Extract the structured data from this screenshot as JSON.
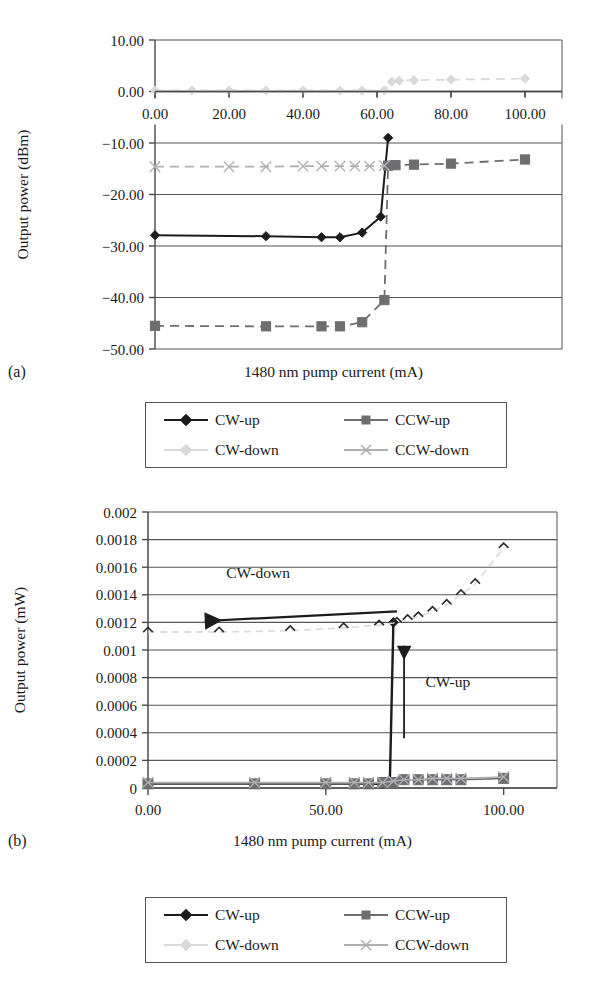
{
  "figure": {
    "panel_a_tag": "(a)",
    "panel_b_tag": "(b)"
  },
  "colors": {
    "cw_up": "#1c1c1c",
    "ccw_up": "#6e6e70",
    "cw_down": "#d9d9d9",
    "ccw_down": "#b0b0b2",
    "axis": "#4a4a4e",
    "grid": "#55555a",
    "text": "#1a1a1a"
  },
  "legend": {
    "entries": [
      {
        "label": "CW-up",
        "series": "cw_up",
        "marker": "diamond",
        "line": true
      },
      {
        "label": "CCW-up",
        "series": "ccw_up",
        "marker": "square",
        "line": true
      },
      {
        "label": "CW-down",
        "series": "cw_down",
        "marker": "diamond",
        "line": true
      },
      {
        "label": "CCW-down",
        "series": "ccw_down",
        "marker": "x",
        "line": true
      }
    ]
  },
  "chart_data": [
    {
      "id": "panel-a",
      "type": "line",
      "title": "",
      "xlabel": "1480 nm pump current (mA)",
      "ylabel": "Output power (dBm)",
      "xlim": [
        0,
        110
      ],
      "ylim": [
        -50,
        10
      ],
      "xticks": [
        0,
        20,
        40,
        60,
        80,
        100
      ],
      "xtick_labels": [
        "0.00",
        "20.00",
        "40.00",
        "60.00",
        "80.00",
        "100.00"
      ],
      "yticks": [
        10,
        0,
        -10,
        -20,
        -30,
        -40,
        -50
      ],
      "ytick_labels": [
        "10.00",
        "0.00",
        "-10.00",
        "-20.00",
        "-30.00",
        "-40.00",
        "-50.00"
      ],
      "grid": true,
      "xaxis_position": "zero",
      "legend_position": "below",
      "series": [
        {
          "name": "CW-up",
          "style": "solid",
          "marker": "diamond",
          "color": "#1c1c1c",
          "x": [
            0,
            30,
            45,
            50,
            56,
            61,
            63
          ],
          "y": [
            -27.9,
            -28.1,
            -28.3,
            -28.3,
            -27.4,
            -24.3,
            -9.0
          ]
        },
        {
          "name": "CCW-up",
          "style": "dashed",
          "marker": "square",
          "color": "#6e6e70",
          "x": [
            0,
            30,
            45,
            50,
            56,
            62,
            63,
            65,
            70,
            80,
            100
          ],
          "y": [
            -45.5,
            -45.6,
            -45.6,
            -45.6,
            -44.8,
            -40.5,
            -14.4,
            -14.3,
            -14.2,
            -14.0,
            -13.2
          ]
        },
        {
          "name": "CW-down",
          "style": "dashed",
          "marker": "diamond",
          "color": "#d9d9d9",
          "x": [
            0,
            10,
            20,
            30,
            40,
            50,
            56,
            62,
            64,
            66,
            70,
            80,
            100
          ],
          "y": [
            0.2,
            0.2,
            0.2,
            0.2,
            0.2,
            0.2,
            0.2,
            0.2,
            1.9,
            2.1,
            2.2,
            2.3,
            2.5
          ]
        },
        {
          "name": "CCW-down",
          "style": "dashed",
          "marker": "x",
          "color": "#b0b0b2",
          "x": [
            0,
            20,
            30,
            40,
            45,
            50,
            54,
            58,
            62
          ],
          "y": [
            -14.6,
            -14.6,
            -14.6,
            -14.5,
            -14.5,
            -14.5,
            -14.5,
            -14.5,
            -14.4
          ]
        }
      ]
    },
    {
      "id": "panel-b",
      "type": "line",
      "title": "",
      "xlabel": "1480 nm pump current (mA)",
      "ylabel": "Output power (mW)",
      "xlim": [
        0,
        115
      ],
      "ylim": [
        0,
        0.002
      ],
      "xticks": [
        0,
        50,
        100
      ],
      "xtick_labels": [
        "0.00",
        "50.00",
        "100.00"
      ],
      "yticks": [
        0.002,
        0.0018,
        0.0016,
        0.0014,
        0.0012,
        0.001,
        0.0008,
        0.0006,
        0.0004,
        0.0002,
        0
      ],
      "ytick_labels": [
        "0.002",
        "0.0018",
        "0.0016",
        "0.0014",
        "0.0012",
        "0.001",
        "0.0008",
        "0.0006",
        "0.0004",
        "0.0002",
        "0"
      ],
      "grid": true,
      "legend_position": "below",
      "annotations": [
        {
          "text": "CW-down",
          "x": 22,
          "y": 0.00152,
          "arrow_to_x": 14,
          "arrow_to_y": 0.00121,
          "arrow_from_x": 70,
          "arrow_from_y": 0.00128
        },
        {
          "text": "CW-up",
          "x": 78,
          "y": 0.00073,
          "arrow_to_x": 72,
          "arrow_to_y": 0.00103,
          "arrow_from_x": 72,
          "arrow_from_y": 0.00036
        }
      ],
      "series": [
        {
          "name": "CW-up",
          "style": "solid",
          "marker": "diamond",
          "color": "#1c1c1c",
          "x": [
            0,
            30,
            50,
            58,
            62,
            66,
            68,
            69
          ],
          "y": [
            3e-05,
            3e-05,
            3e-05,
            3e-05,
            3e-05,
            3e-05,
            4e-05,
            0.0012
          ]
        },
        {
          "name": "CCW-up",
          "style": "solid",
          "marker": "square",
          "color": "#6e6e70",
          "x": [
            0,
            30,
            50,
            58,
            62,
            66,
            69,
            72,
            76,
            80,
            84,
            88,
            100
          ],
          "y": [
            3e-05,
            3e-05,
            3e-05,
            3e-05,
            3e-05,
            4e-05,
            4e-05,
            6e-05,
            6e-05,
            6e-05,
            6e-05,
            6e-05,
            7e-05
          ]
        },
        {
          "name": "CW-down",
          "style": "dashed",
          "marker": "diamond",
          "color": "#d9d9d9",
          "x": [
            0,
            20,
            40,
            55,
            65,
            70,
            73,
            76,
            80,
            84,
            88,
            92,
            100
          ],
          "y": [
            0.00113,
            0.00113,
            0.00114,
            0.00116,
            0.00118,
            0.0012,
            0.00122,
            0.00124,
            0.00128,
            0.00133,
            0.0014,
            0.00148,
            0.00174
          ]
        },
        {
          "name": "CCW-down",
          "style": "solid",
          "marker": "x",
          "color": "#b0b0b2",
          "x": [
            0,
            30,
            50,
            58,
            62,
            66,
            69,
            72,
            76,
            80,
            84,
            88,
            100
          ],
          "y": [
            4e-05,
            4e-05,
            4e-05,
            4e-05,
            4e-05,
            4e-05,
            5e-05,
            6e-05,
            6e-05,
            7e-05,
            7e-05,
            7e-05,
            8e-05
          ]
        }
      ]
    }
  ]
}
